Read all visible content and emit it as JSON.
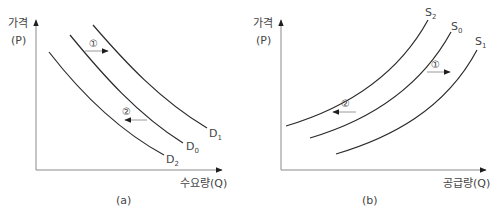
{
  "panels": [
    {
      "id": "a",
      "caption": "(a)",
      "y_axis": {
        "label_line1": "가격",
        "label_line2": "(P)"
      },
      "x_axis": {
        "label": "수요량(Q)"
      },
      "curves": [
        {
          "name": "D1",
          "base": "D",
          "sub": "1"
        },
        {
          "name": "D0",
          "base": "D",
          "sub": "0"
        },
        {
          "name": "D2",
          "base": "D",
          "sub": "2"
        }
      ],
      "shifts": [
        {
          "marker": "①",
          "direction": "right"
        },
        {
          "marker": "②",
          "direction": "left"
        }
      ]
    },
    {
      "id": "b",
      "caption": "(b)",
      "y_axis": {
        "label_line1": "가격",
        "label_line2": "(P)"
      },
      "x_axis": {
        "label": "공급량(Q)"
      },
      "curves": [
        {
          "name": "S2",
          "base": "S",
          "sub": "2"
        },
        {
          "name": "S0",
          "base": "S",
          "sub": "0"
        },
        {
          "name": "S1",
          "base": "S",
          "sub": "1"
        }
      ],
      "shifts": [
        {
          "marker": "①",
          "direction": "right"
        },
        {
          "marker": "②",
          "direction": "left"
        }
      ]
    }
  ],
  "colors": {
    "curve": "#2b2b2b",
    "axis": "#8a8a8a",
    "text": "#444444"
  }
}
